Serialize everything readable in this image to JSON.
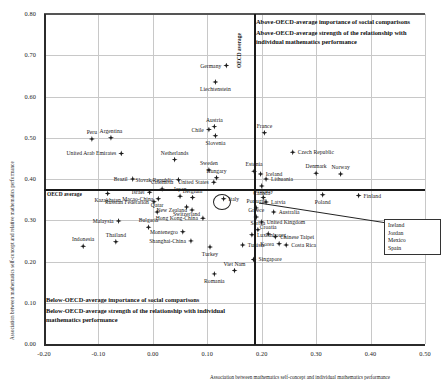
{
  "chart_data": {
    "type": "scatter",
    "title": "",
    "xlabel": "Association between mathematics self-concept and individual mathematics performance",
    "ylabel": "Association between mathematics self-concept and relative mathematics performance",
    "xlim": [
      -0.2,
      0.5
    ],
    "ylim": [
      0.0,
      0.8
    ],
    "xticks": [
      "-0.20",
      "-0.10",
      "0.00",
      "0.10",
      "0.20",
      "0.30",
      "0.40",
      "0.50"
    ],
    "yticks": [
      "0.00",
      "0.10",
      "0.20",
      "0.30",
      "0.40",
      "0.50",
      "0.60",
      "0.70",
      "0.80"
    ],
    "grid": true,
    "reference_lines": {
      "oecd_average_x": 0.185,
      "oecd_average_y": 0.375,
      "x_label": "OECD average",
      "y_label": "OECD average"
    },
    "annotations": {
      "top_right": [
        "Above-OECD-average importance of social comparisons",
        "Above-OECD-average strength of the relationship with individual mathematics performance"
      ],
      "bottom_left": [
        "Below-OECD-average importance of social comparisons",
        "Below-OECD-average strength of the relationship with individual mathematics performance"
      ]
    },
    "legend_box": {
      "title": "",
      "entries": [
        "Ireland",
        "Jordan",
        "Mexico",
        "Spain"
      ]
    },
    "points": [
      {
        "name": "Germany",
        "x": 0.135,
        "y": 0.675,
        "pos": "left"
      },
      {
        "name": "Liechtenstein",
        "x": 0.115,
        "y": 0.635,
        "pos": "below"
      },
      {
        "name": "Peru",
        "x": -0.112,
        "y": 0.497,
        "pos": "above"
      },
      {
        "name": "Argentina",
        "x": -0.077,
        "y": 0.5,
        "pos": "above"
      },
      {
        "name": "United Arab Emirates",
        "x": -0.058,
        "y": 0.462,
        "pos": "left"
      },
      {
        "name": "Austria",
        "x": 0.113,
        "y": 0.527,
        "pos": "above"
      },
      {
        "name": "Chile",
        "x": 0.103,
        "y": 0.52,
        "pos": "left"
      },
      {
        "name": "Slovenia",
        "x": 0.115,
        "y": 0.505,
        "pos": "below"
      },
      {
        "name": "France",
        "x": 0.205,
        "y": 0.512,
        "pos": "above"
      },
      {
        "name": "Netherlands",
        "x": 0.04,
        "y": 0.447,
        "pos": "above"
      },
      {
        "name": "Czech Republic",
        "x": 0.257,
        "y": 0.465,
        "pos": "right"
      },
      {
        "name": "Brazil",
        "x": -0.037,
        "y": 0.4,
        "pos": "left"
      },
      {
        "name": "Sweden",
        "x": 0.103,
        "y": 0.422,
        "pos": "above"
      },
      {
        "name": "Estonia",
        "x": 0.186,
        "y": 0.419,
        "pos": "above"
      },
      {
        "name": "Iceland",
        "x": 0.198,
        "y": 0.412,
        "pos": "right"
      },
      {
        "name": "Denmark",
        "x": 0.3,
        "y": 0.414,
        "pos": "above"
      },
      {
        "name": "Norway",
        "x": 0.345,
        "y": 0.412,
        "pos": "above"
      },
      {
        "name": "Slovak Republic",
        "x": 0.047,
        "y": 0.398,
        "pos": "left"
      },
      {
        "name": "Hungary",
        "x": 0.117,
        "y": 0.403,
        "pos": "above"
      },
      {
        "name": "United States",
        "x": 0.112,
        "y": 0.392,
        "pos": "left"
      },
      {
        "name": "Lithuania",
        "x": 0.208,
        "y": 0.4,
        "pos": "right"
      },
      {
        "name": "Canada",
        "x": 0.2,
        "y": 0.383,
        "pos": "below"
      },
      {
        "name": "Colombia",
        "x": 0.017,
        "y": 0.376,
        "pos": "above"
      },
      {
        "name": "Israel",
        "x": -0.006,
        "y": 0.368,
        "pos": "left"
      },
      {
        "name": "Kazakhstan",
        "x": -0.083,
        "y": 0.365,
        "pos": "below"
      },
      {
        "name": "Japan",
        "x": 0.05,
        "y": 0.358,
        "pos": "above"
      },
      {
        "name": "Macao-China",
        "x": 0.01,
        "y": 0.352,
        "pos": "left"
      },
      {
        "name": "Russian Federation",
        "x": 0.002,
        "y": 0.345,
        "pos": "left"
      },
      {
        "name": "Belgium",
        "x": 0.073,
        "y": 0.355,
        "pos": "above"
      },
      {
        "name": "Italy",
        "x": 0.13,
        "y": 0.352,
        "pos": "right"
      },
      {
        "name": "Uruguay",
        "x": 0.203,
        "y": 0.355,
        "pos": "above"
      },
      {
        "name": "Finland",
        "x": 0.378,
        "y": 0.36,
        "pos": "right"
      },
      {
        "name": "Poland",
        "x": 0.312,
        "y": 0.362,
        "pos": "below"
      },
      {
        "name": "Latvia",
        "x": 0.208,
        "y": 0.344,
        "pos": "right"
      },
      {
        "name": "Switzerland",
        "x": 0.062,
        "y": 0.332,
        "pos": "below"
      },
      {
        "name": "New Zealand",
        "x": 0.072,
        "y": 0.325,
        "pos": "left"
      },
      {
        "name": "Portugal",
        "x": 0.19,
        "y": 0.33,
        "pos": "above"
      },
      {
        "name": "Qatar",
        "x": 0.008,
        "y": 0.32,
        "pos": "above"
      },
      {
        "name": "Australia",
        "x": 0.222,
        "y": 0.32,
        "pos": "right"
      },
      {
        "name": "Hong Kong-China",
        "x": 0.092,
        "y": 0.305,
        "pos": "left"
      },
      {
        "name": "Greece",
        "x": 0.19,
        "y": 0.308,
        "pos": "above"
      },
      {
        "name": "United Kingdom",
        "x": 0.2,
        "y": 0.296,
        "pos": "right"
      },
      {
        "name": "Malaysia",
        "x": -0.063,
        "y": 0.298,
        "pos": "left"
      },
      {
        "name": "Bulgaria",
        "x": -0.008,
        "y": 0.283,
        "pos": "above"
      },
      {
        "name": "Montenegro",
        "x": 0.055,
        "y": 0.272,
        "pos": "left"
      },
      {
        "name": "Serbia",
        "x": 0.193,
        "y": 0.277,
        "pos": "above"
      },
      {
        "name": "Croatia",
        "x": 0.212,
        "y": 0.267,
        "pos": "above"
      },
      {
        "name": "Luxembourg",
        "x": 0.182,
        "y": 0.265,
        "pos": "right"
      },
      {
        "name": "Chinese Taipei",
        "x": 0.225,
        "y": 0.26,
        "pos": "right"
      },
      {
        "name": "Shanghai-China",
        "x": 0.07,
        "y": 0.25,
        "pos": "left"
      },
      {
        "name": "Thailand",
        "x": -0.068,
        "y": 0.248,
        "pos": "above"
      },
      {
        "name": "Indonesia",
        "x": -0.128,
        "y": 0.237,
        "pos": "above"
      },
      {
        "name": "Korea",
        "x": 0.232,
        "y": 0.243,
        "pos": "left"
      },
      {
        "name": "Costa Rica",
        "x": 0.245,
        "y": 0.24,
        "pos": "right"
      },
      {
        "name": "Tunisia",
        "x": 0.165,
        "y": 0.24,
        "pos": "right"
      },
      {
        "name": "Turkey",
        "x": 0.105,
        "y": 0.235,
        "pos": "below"
      },
      {
        "name": "Singapore",
        "x": 0.185,
        "y": 0.205,
        "pos": "right"
      },
      {
        "name": "Viet Nam",
        "x": 0.15,
        "y": 0.178,
        "pos": "above"
      },
      {
        "name": "Romania",
        "x": 0.113,
        "y": 0.17,
        "pos": "below"
      }
    ]
  }
}
